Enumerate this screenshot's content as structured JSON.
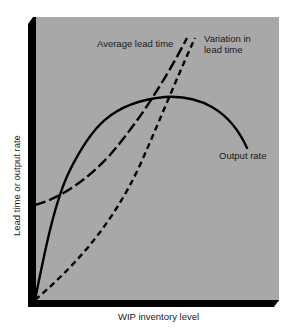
{
  "chart_data": {
    "type": "line",
    "title": "",
    "xlabel": "WIP inventory level",
    "ylabel": "Lead time or output rate",
    "grid": false,
    "legend": "inline labels",
    "background": "#a8a8a8",
    "axis_color": "#000000",
    "x_ticks": [],
    "y_ticks": [],
    "x_range": [
      0,
      100
    ],
    "y_range": [
      0,
      100
    ],
    "series": [
      {
        "name": "Output rate",
        "style": "solid",
        "x": [
          0,
          12,
          22,
          34,
          52,
          66,
          78,
          85
        ],
        "y": [
          0,
          35,
          56,
          66,
          71,
          70,
          65,
          53
        ]
      },
      {
        "name": "Average lead time",
        "style": "long-dash",
        "x": [
          0,
          11,
          22,
          34,
          46,
          54,
          61
        ],
        "y": [
          33,
          37,
          44,
          56,
          70,
          82,
          91
        ]
      },
      {
        "name": "Variation in lead time",
        "style": "short-dash",
        "x": [
          0,
          14,
          30,
          42,
          50,
          57,
          64
        ],
        "y": [
          0,
          12,
          28,
          49,
          63,
          78,
          91
        ]
      }
    ],
    "annotations": [
      "Average lead time",
      "Variation in lead time",
      "Output rate"
    ]
  },
  "labels": {
    "avg_lead_time": "Average lead time",
    "variation_line1": "Variation in",
    "variation_line2": "lead time",
    "output_rate": "Output rate",
    "x_axis": "WIP inventory level",
    "y_axis": "Lead time or output rate"
  },
  "paths": {
    "output_rate": "M35,300 C45,250 55,200 70,170 C90,130 110,102 165,97 C200,95 230,110 247,148",
    "avg_lead_time": "M35,205 C60,198 85,182 110,155 C140,120 165,80 187,38",
    "variation_lead_time": "M35,300 C70,270 110,230 140,165 C160,120 178,75 195,38"
  }
}
